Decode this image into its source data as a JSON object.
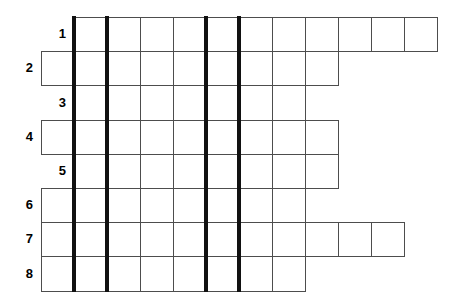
{
  "puzzle": {
    "kind": "crossword-grid",
    "title": "Crossword puzzle grid",
    "row_count": 8,
    "column_count": 12,
    "cell_size": 33,
    "grid_origin": {
      "x": 41,
      "y": 17
    },
    "colors": {
      "background": "#ffffff",
      "cell_fill": "#ffffff",
      "cell_border": "#4d4d4d",
      "heavy_rule": "#111111",
      "number_text": "#000000"
    },
    "rows": [
      {
        "number": "1",
        "start_col": 1,
        "length": 11,
        "label_col": 0
      },
      {
        "number": "2",
        "start_col": 0,
        "length": 9,
        "label_col": -1
      },
      {
        "number": "3",
        "start_col": 1,
        "length": 7,
        "label_col": 0
      },
      {
        "number": "4",
        "start_col": 0,
        "length": 9,
        "label_col": -1
      },
      {
        "number": "5",
        "start_col": 1,
        "length": 8,
        "label_col": 0
      },
      {
        "number": "6",
        "start_col": 0,
        "length": 8,
        "label_col": -1
      },
      {
        "number": "7",
        "start_col": 0,
        "length": 11,
        "label_col": -1
      },
      {
        "number": "8",
        "start_col": 0,
        "length": 8,
        "label_col": -1
      }
    ],
    "heavy_rules": [
      {
        "after_col": 0,
        "x": 74
      },
      {
        "after_col": 1,
        "x": 107
      },
      {
        "after_col": 4,
        "x": 206
      },
      {
        "after_col": 5,
        "x": 239
      }
    ],
    "answers": [
      {
        "number": "1",
        "text": ""
      },
      {
        "number": "2",
        "text": ""
      },
      {
        "number": "3",
        "text": ""
      },
      {
        "number": "4",
        "text": ""
      },
      {
        "number": "5",
        "text": ""
      },
      {
        "number": "6",
        "text": ""
      },
      {
        "number": "7",
        "text": ""
      },
      {
        "number": "8",
        "text": ""
      }
    ]
  }
}
